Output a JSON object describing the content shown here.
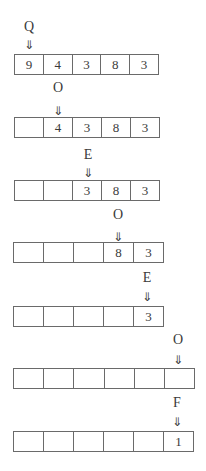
{
  "diagram": {
    "arrow_glyph": "⇓",
    "rows": [
      {
        "label": "Q",
        "arrow": "⇓",
        "cells": [
          "9",
          "4",
          "3",
          "8",
          "3"
        ]
      },
      {
        "label": "O",
        "arrow": "⇓",
        "cells": [
          "",
          "4",
          "3",
          "8",
          "3"
        ]
      },
      {
        "label": "E",
        "arrow": "⇓",
        "cells": [
          "",
          "",
          "3",
          "8",
          "3"
        ]
      },
      {
        "label": "O",
        "arrow": "⇓",
        "cells": [
          "",
          "",
          "",
          "8",
          "3"
        ]
      },
      {
        "label": "E",
        "arrow": "⇓",
        "cells": [
          "",
          "",
          "",
          "",
          "3"
        ]
      },
      {
        "label": "O",
        "arrow": "⇓",
        "cells": [
          "",
          "",
          "",
          "",
          "",
          ""
        ]
      },
      {
        "label": "F",
        "arrow": "⇓",
        "cells": [
          "",
          "",
          "",
          "",
          "",
          "1"
        ]
      }
    ]
  }
}
